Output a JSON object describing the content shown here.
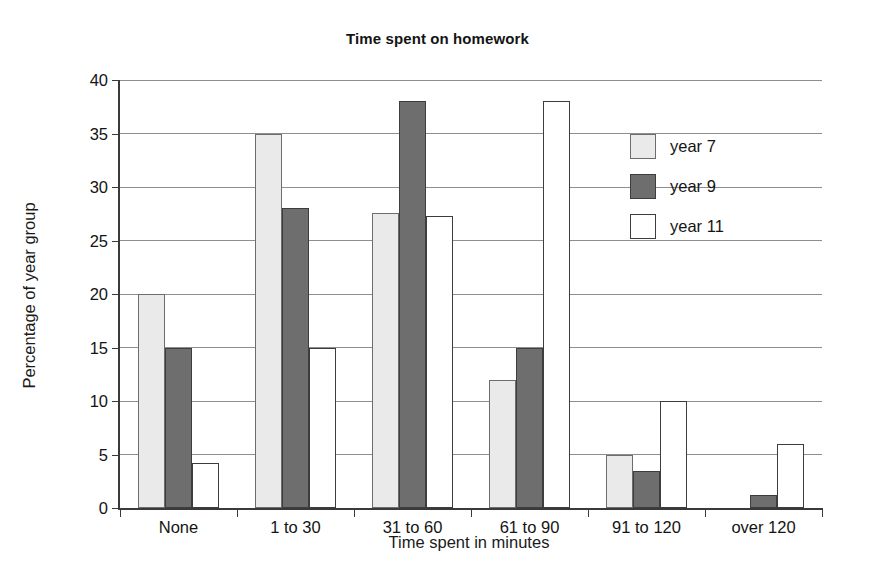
{
  "chart_data": {
    "type": "bar",
    "title": "Time spent on homework",
    "xlabel": "Time spent in minutes",
    "ylabel": "Percentage of year group",
    "categories": [
      "None",
      "1 to 30",
      "31 to 60",
      "61 to 90",
      "91 to 120",
      "over 120"
    ],
    "series": [
      {
        "name": "year 7",
        "color": "#eaeaea",
        "values": [
          20,
          35,
          27.6,
          12,
          5,
          0
        ]
      },
      {
        "name": "year 9",
        "color": "#6e6e6e",
        "values": [
          15,
          28,
          38,
          15,
          3.5,
          1.2
        ]
      },
      {
        "name": "year 11",
        "color": "#ffffff",
        "values": [
          4.2,
          15,
          27.3,
          38,
          10,
          6
        ]
      }
    ],
    "ylim": [
      0,
      40
    ],
    "yticks": [
      0,
      5,
      10,
      15,
      20,
      25,
      30,
      35,
      40
    ],
    "ytick_labels": [
      "0",
      "5",
      "10",
      "15",
      "20",
      "25",
      "30",
      "35",
      "40"
    ],
    "grid": true,
    "legend_position": "upper right",
    "axis_color": "#3a3a3a",
    "grid_color": "#8e8e8e"
  },
  "legend": {
    "items": [
      {
        "label": "year 7",
        "swatch": "legend-swatch-year-7"
      },
      {
        "label": "year 9",
        "swatch": "legend-swatch-year-9"
      },
      {
        "label": "year 11",
        "swatch": "legend-swatch-year-11"
      }
    ]
  }
}
